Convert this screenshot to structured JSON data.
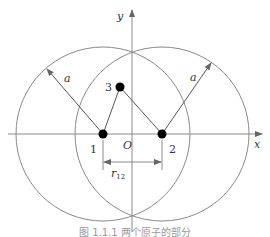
{
  "diagram": {
    "axes": {
      "x_label": "x",
      "y_label": "y",
      "origin_label": "O"
    },
    "atoms": [
      {
        "id": "1",
        "label": "1",
        "cx": 103,
        "cy": 134
      },
      {
        "id": "2",
        "label": "2",
        "cx": 162,
        "cy": 134
      },
      {
        "id": "3",
        "label": "3",
        "cx": 120,
        "cy": 87
      }
    ],
    "circles": [
      {
        "center_atom": "1",
        "radius_label": "a"
      },
      {
        "center_atom": "2",
        "radius_label": "a"
      }
    ],
    "distance": {
      "label_main": "r",
      "label_sub": "12",
      "between": [
        "1",
        "2"
      ]
    }
  },
  "caption": {
    "text": "图 1.1.1  两个原子的部分"
  },
  "colors": {
    "line": "#8a8a8a",
    "bond": "#555555",
    "atom": "#000000"
  }
}
